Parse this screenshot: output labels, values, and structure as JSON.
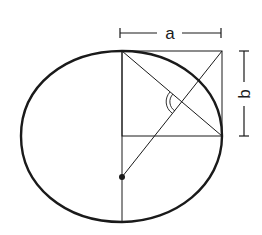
{
  "diagram": {
    "type": "geometric-construction",
    "labels": {
      "width_label": "a",
      "height_label": "b"
    },
    "colors": {
      "stroke": "#1a1a1a",
      "background": "#ffffff"
    },
    "elements": [
      "oval outline",
      "vertical axis line",
      "rectangle a by b",
      "diagonal from top-left to right-mid",
      "line from top-right corner to center point",
      "horizontal line at rectangle bottom",
      "double angle arc",
      "center point dot",
      "dimension line a",
      "dimension line b"
    ]
  }
}
